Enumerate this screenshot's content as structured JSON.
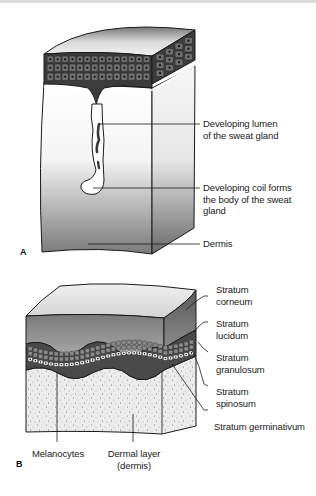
{
  "figure": {
    "panels": [
      {
        "id": "A",
        "letter": "A",
        "title": "Developing sweat gland",
        "labels": {
          "lumen_line1": "Developing lumen",
          "lumen_line2": "of the sweat gland",
          "coil_line1": "Developing coil forms",
          "coil_line2": "the body of the sweat",
          "coil_line3": "gland",
          "dermis": "Dermis"
        }
      },
      {
        "id": "B",
        "letter": "B",
        "title": "Layers of the epidermis",
        "labels": {
          "corneum_line1": "Stratum",
          "corneum_line2": "corneum",
          "lucidum_line1": "Stratum",
          "lucidum_line2": "lucidum",
          "granulosum_line1": "Stratum",
          "granulosum_line2": "granulosum",
          "spinosum_line1": "Stratum",
          "spinosum_line2": "spinosum",
          "germinativum": "Stratum germinativum",
          "melanocytes": "Melanocytes",
          "dermal_line1": "Dermal layer",
          "dermal_line2": "(dermis)"
        }
      }
    ]
  },
  "colors": {
    "ink": "#1a1a1a",
    "cell_fill": "#6e6e6e",
    "corneum_top": "#e6e6e6",
    "corneum_side": "#8a8a8a",
    "dermis_stipple": "#e8e8e8"
  }
}
